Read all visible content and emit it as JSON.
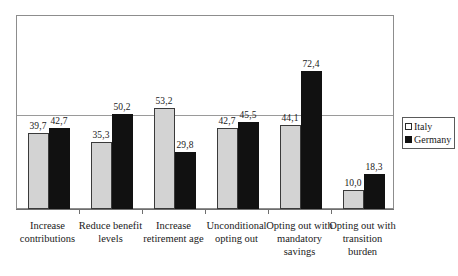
{
  "chart_data": {
    "type": "bar",
    "title": "",
    "subtitle": "",
    "xlabel": "",
    "ylabel": "",
    "ylim": [
      0,
      102
    ],
    "grid": true,
    "gridline_values": [
      50
    ],
    "legend_position": "right",
    "decimal_separator": ",",
    "categories": [
      "Increase contributions",
      "Reduce benefit levels",
      "Increase retirement age",
      "Unconditional opting out",
      "Opting out with mandatory savings",
      "Opting out with transition burden"
    ],
    "series": [
      {
        "name": "Italy",
        "color": "#d3d3d3",
        "values": [
          39.7,
          35.3,
          53.2,
          42.7,
          44.1,
          10.0
        ],
        "labels": [
          "39,7",
          "35,3",
          "53,2",
          "42,7",
          "44,1",
          "10,0"
        ]
      },
      {
        "name": "Germany",
        "color": "#111111",
        "values": [
          42.7,
          50.2,
          29.8,
          45.5,
          72.4,
          18.3
        ],
        "labels": [
          "42,7",
          "50,2",
          "29,8",
          "45,5",
          "72,4",
          "18,3"
        ]
      }
    ]
  },
  "category_lines": [
    [
      "Increase",
      "contributions"
    ],
    [
      "Reduce benefit",
      "levels"
    ],
    [
      "Increase",
      "retirement age"
    ],
    [
      "Unconditional",
      "opting out"
    ],
    [
      "Opting out with",
      "mandatory",
      "savings"
    ],
    [
      "Opting out with",
      "transition burden"
    ]
  ],
  "legend": {
    "items": [
      {
        "label": "Italy",
        "swatch": "legend-swatch-italy"
      },
      {
        "label": "Germany",
        "swatch": "legend-swatch-germany"
      }
    ]
  }
}
